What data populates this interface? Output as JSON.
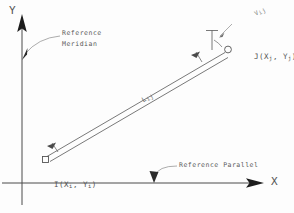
{
  "figure": {
    "type": "survey-traverse-diagram",
    "background_color": "#fdfdfd",
    "ink_color": "#4a4a4a"
  },
  "axes": {
    "y": {
      "label": "Y",
      "name": "reference-meridian-axis",
      "x_px": 22,
      "top_px": 18,
      "bottom_px": 205
    },
    "x": {
      "label": "X",
      "name": "reference-parallel-axis",
      "y_px": 183,
      "left_px": 2,
      "right_px": 262
    }
  },
  "annotations": {
    "meridian": {
      "line1": "Reference",
      "line2": "Meridian",
      "leader_to_x": 22,
      "leader_to_y": 58
    },
    "parallel": {
      "text": "Reference Parallel",
      "leader_to_x": 155,
      "leader_to_y": 181
    }
  },
  "points": {
    "i": {
      "label_prefix": "I(X",
      "label_sub1": "i",
      "label_mid": ", Y",
      "label_sub2": "i",
      "label_suffix": ")",
      "label_plain": "I(Xi, Yi)",
      "x_px": 44,
      "y_px": 155
    },
    "j": {
      "label_prefix": "J(X",
      "label_sub1": "j",
      "label_mid": ", Y",
      "label_sub2": "j",
      "label_suffix": ")",
      "label_plain": "J(Xj, Yj)",
      "x_px": 228,
      "y_px": 48
    }
  },
  "segment": {
    "label_prefix": "L",
    "label_sub": "ij",
    "label_plain": "L ij",
    "from": "i",
    "to": "j"
  },
  "azimuth": {
    "label_prefix": "V",
    "label_sub": "ij",
    "label_plain": "V ij"
  }
}
